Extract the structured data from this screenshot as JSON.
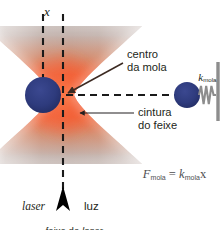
{
  "figure": {
    "width": 223,
    "height": 230,
    "background": "#ffffff"
  },
  "axis": {
    "label": "x",
    "style": "italic-serif"
  },
  "annotations": {
    "centro_da_mola": "centro\nda mola",
    "cintura_do_feixe": "cintura\ndo feixe",
    "k_mola_symbol": "k",
    "k_mola_subscript": "mola"
  },
  "formula": {
    "lhs_symbol": "F",
    "lhs_subscript": "mola",
    "equals": "=",
    "rhs_symbol": "k",
    "rhs_subscript": "mola",
    "rhs_variable": "x",
    "full_text": "F_mola = k_mola x"
  },
  "bottom_labels": {
    "laser": "laser",
    "luz": "luz",
    "caption_prefix": "feixe de ",
    "caption_italic": "laser"
  },
  "colors": {
    "beam_core": "#f0562d",
    "beam_core_bright": "#f4633a",
    "beam_halo": "#bdb0ab",
    "beam_halo_soft": "#cfc5c0",
    "bead": "#2e3b7d",
    "bead_dark": "#27326b",
    "spring": "#8d8d8d",
    "wall": "#8d8d8d",
    "dashes": "#1a1a1a",
    "arrow": "#3c2a22",
    "text": "#231f20",
    "formula_text": "#4d4d4f"
  },
  "elements": {
    "left_bead": {
      "cx": 43,
      "cy": 95,
      "r": 18
    },
    "right_bead": {
      "cx": 187,
      "cy": 95,
      "r": 13
    },
    "beam_waist_y": 95,
    "beam_axis_x": 63,
    "spring_coils": 4,
    "wall_x": 217
  }
}
